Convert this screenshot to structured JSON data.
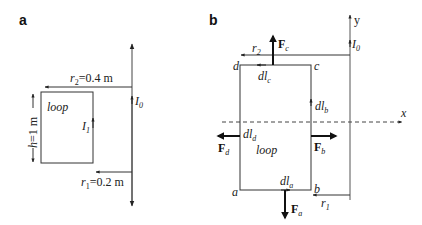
{
  "panels": {
    "a": {
      "label": "a",
      "wire_current": "I",
      "wire_current_sub": "0",
      "loop_label": "loop",
      "loop_current": "I",
      "loop_current_sub": "1",
      "height_label_var": "h",
      "height_label_val": "=1 m",
      "r2_var": "r",
      "r2_sub": "2",
      "r2_val": "=0.4 m",
      "r1_var": "r",
      "r1_sub": "1",
      "r1_val": "=0.2 m"
    },
    "b": {
      "label": "b",
      "axis_y": "y",
      "axis_x": "x",
      "wire_current": "I",
      "wire_current_sub": "0",
      "loop_label": "loop",
      "corners": {
        "a": "a",
        "b": "b",
        "c": "c",
        "d": "d"
      },
      "r2_var": "r",
      "r2_sub": "2",
      "r1_var": "r",
      "r1_sub": "1",
      "elements": {
        "a": {
          "var": "dl",
          "sub": "a"
        },
        "b": {
          "var": "dl",
          "sub": "b"
        },
        "c": {
          "var": "dl",
          "sub": "c"
        },
        "d": {
          "var": "dl",
          "sub": "d"
        }
      },
      "forces": {
        "a": {
          "var": "F",
          "sub": "a"
        },
        "b": {
          "var": "F",
          "sub": "b"
        },
        "c": {
          "var": "F",
          "sub": "c"
        },
        "d": {
          "var": "F",
          "sub": "d"
        }
      }
    }
  },
  "colors": {
    "line": "#333333",
    "wire": "#555555"
  }
}
